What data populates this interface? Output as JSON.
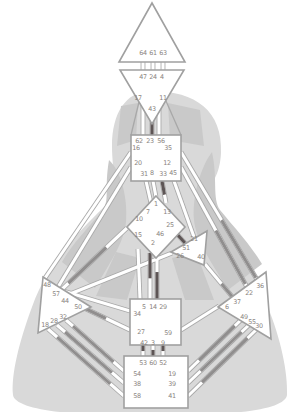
{
  "colors": {
    "background": "#ffffff",
    "silhouette_light": "#d9d9d9",
    "silhouette_shade": "#c9c9c9",
    "center_fill": "#ffffff",
    "center_stroke": "#a0a0a0",
    "channel_casing": "#a8a8a8",
    "channel_fill": "#ffffff",
    "activation_dark": "#5d5555",
    "activation_mid": "#908e8e",
    "gate_label": "#8a8480"
  },
  "bodygraph": {
    "centers": [
      {
        "id": "head",
        "shape": "polygon",
        "points": "152,3 119,62 185,62",
        "gates": [
          {
            "n": "64",
            "x": 143,
            "y": 53
          },
          {
            "n": "61",
            "x": 153,
            "y": 53
          },
          {
            "n": "63",
            "x": 163,
            "y": 53
          }
        ]
      },
      {
        "id": "ajna",
        "shape": "polygon",
        "points": "120,70 184,70 152,124",
        "gates": [
          {
            "n": "47",
            "x": 143,
            "y": 77
          },
          {
            "n": "24",
            "x": 153,
            "y": 77
          },
          {
            "n": "4",
            "x": 162,
            "y": 77
          },
          {
            "n": "17",
            "x": 138,
            "y": 98
          },
          {
            "n": "43",
            "x": 152,
            "y": 109
          },
          {
            "n": "11",
            "x": 163,
            "y": 98
          }
        ]
      },
      {
        "id": "throat",
        "shape": "rect",
        "x": 131,
        "y": 135,
        "w": 50,
        "h": 46,
        "gates": [
          {
            "n": "62",
            "x": 139,
            "y": 141
          },
          {
            "n": "23",
            "x": 150,
            "y": 141
          },
          {
            "n": "56",
            "x": 161,
            "y": 141
          },
          {
            "n": "16",
            "x": 136,
            "y": 148
          },
          {
            "n": "35",
            "x": 168,
            "y": 148
          },
          {
            "n": "20",
            "x": 138,
            "y": 163
          },
          {
            "n": "12",
            "x": 167,
            "y": 163
          },
          {
            "n": "31",
            "x": 144,
            "y": 174
          },
          {
            "n": "8",
            "x": 152,
            "y": 173
          },
          {
            "n": "33",
            "x": 163,
            "y": 174
          },
          {
            "n": "45",
            "x": 173,
            "y": 173
          }
        ]
      },
      {
        "id": "g-center",
        "shape": "polygon",
        "points": "156,196 185,227 156,258 127,227",
        "gates": [
          {
            "n": "1",
            "x": 156,
            "y": 204
          },
          {
            "n": "7",
            "x": 148,
            "y": 212
          },
          {
            "n": "13",
            "x": 167,
            "y": 212
          },
          {
            "n": "10",
            "x": 139,
            "y": 219
          },
          {
            "n": "25",
            "x": 170,
            "y": 225
          },
          {
            "n": "15",
            "x": 138,
            "y": 235
          },
          {
            "n": "46",
            "x": 160,
            "y": 234
          },
          {
            "n": "2",
            "x": 153,
            "y": 243
          }
        ]
      },
      {
        "id": "heart",
        "shape": "polygon",
        "points": "171,252 207,231 204,265",
        "gates": [
          {
            "n": "21",
            "x": 194,
            "y": 239
          },
          {
            "n": "51",
            "x": 186,
            "y": 248
          },
          {
            "n": "26",
            "x": 180,
            "y": 256
          },
          {
            "n": "40",
            "x": 201,
            "y": 257
          }
        ]
      },
      {
        "id": "spleen",
        "shape": "polygon",
        "points": "43,277 91,307 38,333",
        "gates": [
          {
            "n": "48",
            "x": 47,
            "y": 285
          },
          {
            "n": "57",
            "x": 56,
            "y": 294
          },
          {
            "n": "44",
            "x": 65,
            "y": 301
          },
          {
            "n": "50",
            "x": 78,
            "y": 307
          },
          {
            "n": "32",
            "x": 63,
            "y": 317
          },
          {
            "n": "28",
            "x": 54,
            "y": 321
          },
          {
            "n": "18",
            "x": 45,
            "y": 325
          }
        ]
      },
      {
        "id": "solar-plexus",
        "shape": "polygon",
        "points": "266,272 218,307 271,339",
        "gates": [
          {
            "n": "36",
            "x": 260,
            "y": 286
          },
          {
            "n": "22",
            "x": 249,
            "y": 293
          },
          {
            "n": "37",
            "x": 237,
            "y": 302
          },
          {
            "n": "6",
            "x": 227,
            "y": 307
          },
          {
            "n": "49",
            "x": 244,
            "y": 317
          },
          {
            "n": "55",
            "x": 252,
            "y": 322
          },
          {
            "n": "30",
            "x": 259,
            "y": 326
          }
        ]
      },
      {
        "id": "sacral",
        "shape": "rect",
        "x": 130,
        "y": 299,
        "w": 51,
        "h": 46,
        "gates": [
          {
            "n": "5",
            "x": 144,
            "y": 307
          },
          {
            "n": "14",
            "x": 153,
            "y": 307
          },
          {
            "n": "29",
            "x": 163,
            "y": 307
          },
          {
            "n": "34",
            "x": 137,
            "y": 314
          },
          {
            "n": "27",
            "x": 141,
            "y": 332
          },
          {
            "n": "59",
            "x": 168,
            "y": 333
          },
          {
            "n": "42",
            "x": 144,
            "y": 343
          },
          {
            "n": "3",
            "x": 153,
            "y": 343
          },
          {
            "n": "9",
            "x": 163,
            "y": 343
          }
        ]
      },
      {
        "id": "root",
        "shape": "rect",
        "x": 124,
        "y": 356,
        "w": 64,
        "h": 52,
        "gates": [
          {
            "n": "53",
            "x": 143,
            "y": 363
          },
          {
            "n": "60",
            "x": 153,
            "y": 363
          },
          {
            "n": "52",
            "x": 163,
            "y": 363
          },
          {
            "n": "54",
            "x": 137,
            "y": 374
          },
          {
            "n": "19",
            "x": 172,
            "y": 374
          },
          {
            "n": "38",
            "x": 137,
            "y": 384
          },
          {
            "n": "39",
            "x": 172,
            "y": 384
          },
          {
            "n": "58",
            "x": 137,
            "y": 396
          },
          {
            "n": "41",
            "x": 172,
            "y": 396
          }
        ]
      }
    ],
    "channels": [
      {
        "id": "64-47",
        "x1": 143,
        "y1": 62,
        "x2": 143,
        "y2": 70,
        "segments": []
      },
      {
        "id": "61-24",
        "x1": 153,
        "y1": 62,
        "x2": 153,
        "y2": 70,
        "segments": []
      },
      {
        "id": "63-4",
        "x1": 163,
        "y1": 62,
        "x2": 163,
        "y2": 70,
        "segments": []
      },
      {
        "id": "17-62",
        "x1": 143,
        "y1": 104,
        "x2": 143,
        "y2": 135,
        "segments": []
      },
      {
        "id": "43-23",
        "x1": 152,
        "y1": 112,
        "x2": 152,
        "y2": 135,
        "segments": [
          {
            "t0": 0.4,
            "t1": 1,
            "tone": "dark"
          }
        ]
      },
      {
        "id": "11-56",
        "x1": 159,
        "y1": 104,
        "x2": 159,
        "y2": 135,
        "segments": []
      },
      {
        "id": "31-7",
        "x1": 146,
        "y1": 181,
        "x2": 151,
        "y2": 203,
        "segments": []
      },
      {
        "id": "8-1",
        "x1": 153,
        "y1": 181,
        "x2": 156,
        "y2": 197,
        "segments": []
      },
      {
        "id": "33-13",
        "x1": 162,
        "y1": 181,
        "x2": 166,
        "y2": 203,
        "segments": [
          {
            "t0": 0,
            "t1": 0.62,
            "tone": "dark"
          }
        ]
      },
      {
        "id": "45-21",
        "x1": 174,
        "y1": 181,
        "x2": 194,
        "y2": 237,
        "segments": []
      },
      {
        "id": "16-48",
        "x1": 131,
        "y1": 152,
        "x2": 45,
        "y2": 278,
        "segments": []
      },
      {
        "id": "20-57",
        "x1": 131,
        "y1": 167,
        "x2": 55,
        "y2": 292,
        "segments": []
      },
      {
        "id": "35-36",
        "x1": 181,
        "y1": 152,
        "x2": 259,
        "y2": 283,
        "segments": [
          {
            "t0": 0.52,
            "t1": 0.96,
            "tone": "mid"
          }
        ]
      },
      {
        "id": "12-22",
        "x1": 181,
        "y1": 167,
        "x2": 248,
        "y2": 289,
        "segments": [
          {
            "t0": 0.52,
            "t1": 0.96,
            "tone": "mid"
          }
        ]
      },
      {
        "id": "10-57",
        "x1": 127,
        "y1": 228,
        "x2": 58,
        "y2": 293,
        "segments": [
          {
            "t0": 0.3,
            "t1": 0.85,
            "tone": "mid"
          }
        ]
      },
      {
        "id": "15-5",
        "x1": 138,
        "y1": 249,
        "x2": 140,
        "y2": 299,
        "segments": []
      },
      {
        "id": "2-14",
        "x1": 150,
        "y1": 253,
        "x2": 150,
        "y2": 299,
        "segments": [
          {
            "t0": 0,
            "t1": 0.55,
            "tone": "dark"
          }
        ]
      },
      {
        "id": "46-29",
        "x1": 157,
        "y1": 250,
        "x2": 157,
        "y2": 299,
        "segments": [
          {
            "t0": 0.45,
            "t1": 1,
            "tone": "dark"
          }
        ]
      },
      {
        "id": "25-51",
        "x1": 176,
        "y1": 233,
        "x2": 185,
        "y2": 243,
        "segments": [
          {
            "t0": 0,
            "t1": 1,
            "tone": "dark"
          }
        ]
      },
      {
        "id": "44-26",
        "x1": 70,
        "y1": 294,
        "x2": 172,
        "y2": 253,
        "segments": []
      },
      {
        "id": "50-27",
        "x1": 82,
        "y1": 307,
        "x2": 130,
        "y2": 330,
        "segments": [
          {
            "t0": 0,
            "t1": 0.5,
            "tone": "mid"
          }
        ]
      },
      {
        "id": "57-34",
        "x1": 60,
        "y1": 290,
        "x2": 130,
        "y2": 311,
        "segments": []
      },
      {
        "id": "37-40",
        "x1": 235,
        "y1": 300,
        "x2": 205,
        "y2": 264,
        "segments": [
          {
            "t0": 0,
            "t1": 0.45,
            "tone": "mid"
          }
        ]
      },
      {
        "id": "6-59",
        "x1": 219,
        "y1": 306,
        "x2": 181,
        "y2": 330,
        "segments": []
      },
      {
        "id": "32-54",
        "x1": 66,
        "y1": 320,
        "x2": 124,
        "y2": 371,
        "segments": [
          {
            "t0": 0.12,
            "t1": 0.82,
            "tone": "mid"
          }
        ]
      },
      {
        "id": "28-38",
        "x1": 57,
        "y1": 325,
        "x2": 124,
        "y2": 383,
        "segments": [
          {
            "t0": 0.12,
            "t1": 0.82,
            "tone": "mid"
          }
        ]
      },
      {
        "id": "18-58",
        "x1": 48,
        "y1": 329,
        "x2": 124,
        "y2": 396,
        "segments": [
          {
            "t0": 0.12,
            "t1": 0.82,
            "tone": "mid"
          }
        ]
      },
      {
        "id": "49-19",
        "x1": 243,
        "y1": 318,
        "x2": 188,
        "y2": 371,
        "segments": [
          {
            "t0": 0.15,
            "t1": 0.8,
            "tone": "mid"
          }
        ]
      },
      {
        "id": "55-39",
        "x1": 251,
        "y1": 323,
        "x2": 188,
        "y2": 383,
        "segments": [
          {
            "t0": 0.15,
            "t1": 0.8,
            "tone": "mid"
          }
        ]
      },
      {
        "id": "30-41",
        "x1": 258,
        "y1": 328,
        "x2": 188,
        "y2": 396,
        "segments": [
          {
            "t0": 0.15,
            "t1": 0.8,
            "tone": "mid"
          }
        ]
      },
      {
        "id": "42-53",
        "x1": 143,
        "y1": 345,
        "x2": 143,
        "y2": 356,
        "segments": [
          {
            "t0": 0,
            "t1": 0.55,
            "tone": "dark"
          }
        ]
      },
      {
        "id": "3-60",
        "x1": 153,
        "y1": 345,
        "x2": 153,
        "y2": 356,
        "segments": [
          {
            "t0": 0.45,
            "t1": 1,
            "tone": "dark"
          }
        ]
      },
      {
        "id": "9-52",
        "x1": 163,
        "y1": 345,
        "x2": 163,
        "y2": 356,
        "segments": [
          {
            "t0": 0,
            "t1": 0.55,
            "tone": "dark"
          }
        ]
      }
    ],
    "accents": [
      {
        "id": "ajna-funnel-left",
        "x1": 139,
        "y1": 102,
        "x2": 131,
        "y2": 135
      },
      {
        "id": "ajna-funnel-right",
        "x1": 166,
        "y1": 101,
        "x2": 181,
        "y2": 135
      }
    ]
  }
}
